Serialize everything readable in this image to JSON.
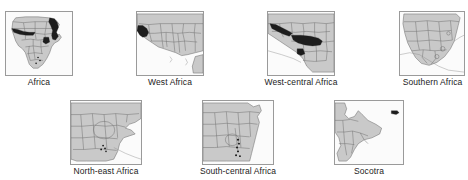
{
  "figure": {
    "title": "",
    "background_color": "#ffffff",
    "land_color": "#c9c9c9",
    "border_color": "#6d6d6d",
    "highlight_color": "#1d1d1d",
    "panel_frame_color": "#9a9a9a",
    "rows": 2,
    "panels_top_row": 4,
    "panels_bottom_row": 3,
    "total_panels": 7
  },
  "panels": [
    {
      "id": "africa",
      "caption": "Africa",
      "row": 1,
      "column": 1,
      "extent": "whole continent",
      "highlight_region": "north-east Africa / Horn and Red Sea coast"
    },
    {
      "id": "west-africa",
      "caption": "West Africa",
      "row": 1,
      "column": 2,
      "extent": "West African bulge and Gulf of Guinea",
      "highlight_region": "western coastal Guinea / Sierra Leone / Liberia"
    },
    {
      "id": "west-central-africa",
      "caption": "West-central Africa",
      "row": 1,
      "column": 3,
      "extent": "Gulf of Guinea to Congo basin",
      "highlight_region": "Cameroon, Gabon, Congo basin band and Upper Guinea coast"
    },
    {
      "id": "southern-africa",
      "caption": "Southern Africa",
      "row": 1,
      "column": 4,
      "extent": "Angola, Zambia, Zimbabwe, South Africa",
      "highlight_region": "eastern escarpment localities"
    },
    {
      "id": "north-east-africa",
      "caption": "North-east Africa",
      "row": 2,
      "column": 1,
      "extent": "Sudan, Ethiopia, Somalia, Kenya",
      "highlight_region": "southern Ethiopian highlands / Kenya border"
    },
    {
      "id": "south-central-africa",
      "caption": "South-central Africa",
      "row": 2,
      "column": 2,
      "extent": "Congo, Tanzania, Malawi, Mozambique",
      "highlight_region": "Albertine Rift and Lake Malawi corridor"
    },
    {
      "id": "socotra",
      "caption": "Socotra",
      "row": 2,
      "column": 3,
      "extent": "Horn of Africa and Arabian Sea",
      "highlight_region": "Socotra island, north-east of the Horn"
    }
  ]
}
